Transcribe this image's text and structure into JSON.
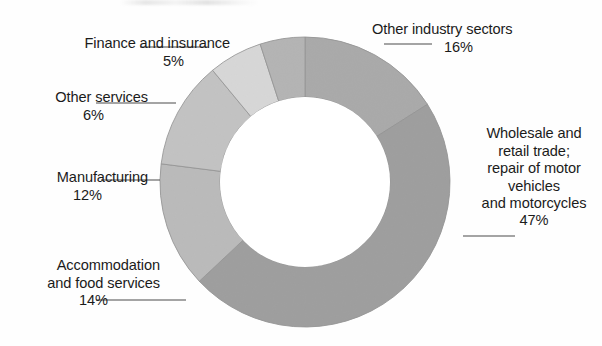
{
  "page": {
    "background": "#fefefe",
    "text_color": "#1b1b1b",
    "width": 602,
    "height": 346
  },
  "chart_data": {
    "type": "pie",
    "variant": "donut",
    "title": "",
    "subtitle": "",
    "xlabel": "",
    "ylabel": "",
    "legend_position": "none",
    "labels_position": "outside-with-leader-lines",
    "grid": false,
    "hole_ratio": 0.59,
    "units": "percent",
    "total": 100,
    "start_angle_deg": 0,
    "direction": "clockwise",
    "categories": [
      "Other industry sectors",
      "Wholesale and retail trade; repair of motor vehicles and motorcycles",
      "Accommodation and food services",
      "Manufacturing",
      "Other services",
      "Finance and insurance"
    ],
    "values": [
      16,
      47,
      14,
      12,
      6,
      5
    ],
    "colors": [
      "#a8a8a8",
      "#9a9a9a",
      "#bdbdbd",
      "#c7c7c7",
      "#e0e0e0",
      "#b5b5b5"
    ],
    "slices": [
      {
        "id": "other-industry",
        "label": "Other industry sectors",
        "value": 16,
        "value_text": "16%",
        "color": "#a8a8a8",
        "start_deg": 0,
        "end_deg": 57.6
      },
      {
        "id": "wholesale",
        "label": "Wholesale and retail trade; repair of motor vehicles and motorcycles",
        "label_lines": "Wholesale and\nretail trade;\nrepair of motor\nvehicles\nand motorcycles",
        "value": 47,
        "value_text": "47%",
        "color": "#9a9a9a",
        "start_deg": 57.6,
        "end_deg": 226.8
      },
      {
        "id": "accommodation",
        "label": "Accommodation and food services",
        "label_lines": "Accommodation\nand food services",
        "value": 14,
        "value_text": "14%",
        "color": "#bdbdbd",
        "start_deg": 226.8,
        "end_deg": 277.2
      },
      {
        "id": "manufacturing",
        "label": "Manufacturing",
        "label_lines": "Manufacturing",
        "value": 12,
        "value_text": "12%",
        "color": "#c7c7c7",
        "start_deg": 277.2,
        "end_deg": 320.4
      },
      {
        "id": "other-services",
        "label": "Other services",
        "label_lines": "Other services",
        "value": 6,
        "value_text": "6%",
        "color": "#e0e0e0",
        "start_deg": 320.4,
        "end_deg": 342.0
      },
      {
        "id": "finance",
        "label": "Finance and insurance",
        "label_lines": "Finance and insurance",
        "value": 5,
        "value_text": "5%",
        "color": "#b5b5b5",
        "start_deg": 342.0,
        "end_deg": 360.0
      }
    ]
  },
  "labels": {
    "other_industry": {
      "text": "Other industry sectors",
      "value_text": "16%"
    },
    "wholesale": {
      "text": "Wholesale and\nretail trade;\nrepair of motor\nvehicles\nand motorcycles",
      "value_text": "47%"
    },
    "accommodation": {
      "text": "Accommodation\nand food services",
      "value_text": "14%"
    },
    "manufacturing": {
      "text": "Manufacturing",
      "value_text": "12%"
    },
    "other_services": {
      "text": "Other services",
      "value_text": "6%"
    },
    "finance": {
      "text": "Finance and insurance",
      "value_text": "5%"
    }
  }
}
